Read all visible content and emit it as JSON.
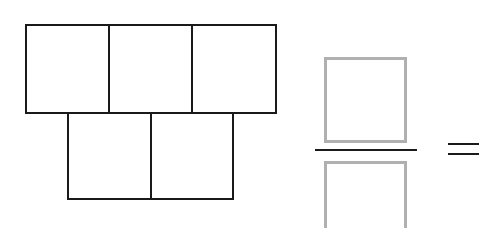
{
  "diagram": {
    "top_row_squares": 3,
    "bottom_row_squares": 2,
    "total_squares": 5,
    "fraction": {
      "numerator": "",
      "denominator": ""
    },
    "operator": "=",
    "colors": {
      "outline": "#1a1a1a",
      "answer_box": "#b0b0b0"
    }
  }
}
